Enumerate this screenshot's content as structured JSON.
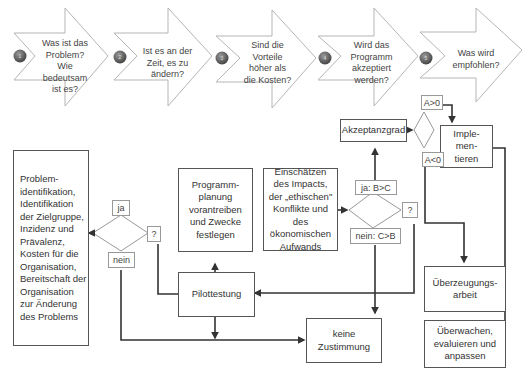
{
  "steps": [
    {
      "number": "1",
      "question": "Was ist das\nProblem?\nWie\nbedeutsam\nist es?"
    },
    {
      "number": "2",
      "question": "Ist es an der\nZeit, es zu\nändern?"
    },
    {
      "number": "3",
      "question": "Sind die\nVorteile\nhöher als\ndie Kosten?"
    },
    {
      "number": "4",
      "question": "Wird das\nProgramm\nakzeptiert\nwerden?"
    },
    {
      "number": "5",
      "question": "Was wird\nempfohlen?"
    }
  ],
  "boxes": {
    "problem": "Problem-\nidentifikation,\nIdentifikation\nder Zielgruppe,\nInzidenz und\nPrävalenz,\nKosten für die\nOrganisation,\nBereitschaft der\nOrganisation\nzur Änderung\ndes Problems",
    "programmplanung": "Programm-\nplanung\nvorantreiben\nund Zwecke\nfestlegen",
    "impact": "Einschätzen\ndes Impacts,\nder „ethischen\"\nKonflikte und\ndes\nökonomischen\nAufwands",
    "pilottestung": "Pilottestung",
    "keine_zustimmung": "keine\nZustimmung",
    "akzeptanzgrad": "Akzeptanzgrad",
    "implementieren": "Imple-\nmen-\ntieren",
    "ueberzeugungsarbeit": "Überzeugungs-\narbeit",
    "ueberwachen": "Überwachen,\nevaluieren und\nanpassen"
  },
  "labels": {
    "d1_yes": "ja",
    "d1_no": "nein",
    "d1_unknown": "?",
    "d2_yes": "ja: B>C",
    "d2_no": "nein: C>B",
    "d2_unknown": "?",
    "d3_pos": "A>0",
    "d3_neg": "A<0"
  },
  "colors": {
    "line": "#333333",
    "thin_line": "#888888",
    "badge": "#5a5a5a"
  }
}
